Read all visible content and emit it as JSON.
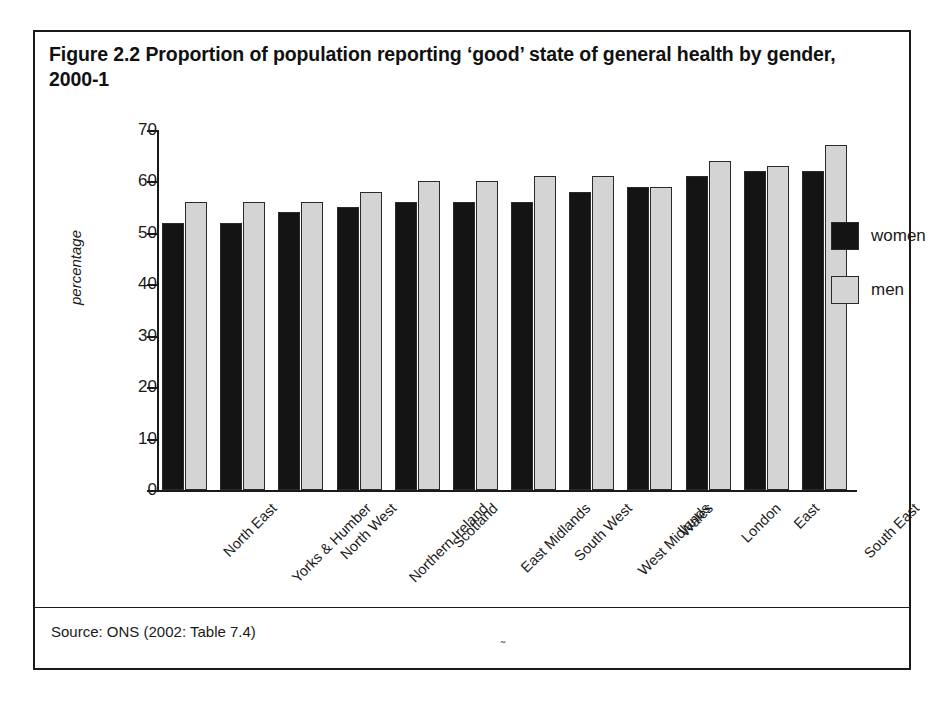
{
  "figure": {
    "title": "Figure 2.2 Proportion of population reporting ‘good’ state of general health by gender, 2000-1",
    "source": "Source: ONS (2002: Table 7.4)",
    "page_mark": "˜"
  },
  "legend": {
    "position": "right",
    "entries": [
      {
        "label": "women",
        "color": "#141414"
      },
      {
        "label": "men",
        "color": "#d4d4d4"
      }
    ]
  },
  "chart_data": {
    "type": "bar",
    "title": "Figure 2.2 Proportion of population reporting ‘good’ state of general health by gender, 2000-1",
    "xlabel": "",
    "ylabel": "percentage",
    "ylim": [
      0,
      70
    ],
    "yticks": [
      0,
      10,
      20,
      30,
      40,
      50,
      60,
      70
    ],
    "ytick_labels": [
      "0",
      "10",
      "20",
      "30",
      "40",
      "50",
      "60",
      "70"
    ],
    "grid": false,
    "legend_position": "right",
    "categories": [
      "North East",
      "Yorks & Humber",
      "North West",
      "Northern Ireland",
      "Scotland",
      "East Midlands",
      "South West",
      "West Midlands",
      "Wales",
      "London",
      "East",
      "South East"
    ],
    "series": [
      {
        "name": "women",
        "color": "#141414",
        "values": [
          52,
          52,
          54,
          55,
          56,
          56,
          56,
          58,
          59,
          61,
          62,
          62
        ]
      },
      {
        "name": "men",
        "color": "#d4d4d4",
        "values": [
          56,
          56,
          56,
          58,
          60,
          60,
          61,
          61,
          59,
          64,
          63,
          67
        ]
      }
    ],
    "source": "Source: ONS (2002: Table 7.4)"
  }
}
